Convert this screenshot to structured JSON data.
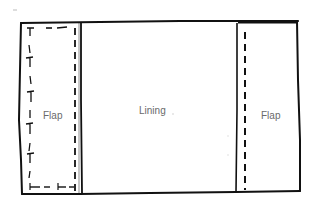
{
  "diagram": {
    "type": "sewing-pattern-sketch",
    "panels": [
      {
        "name": "left-flap",
        "label": "Flap"
      },
      {
        "name": "lining",
        "label": "Lining"
      },
      {
        "name": "right-flap",
        "label": "Flap"
      }
    ],
    "colors": {
      "line": "#111111",
      "label": "#6a6a6a",
      "background": "#ffffff"
    }
  }
}
